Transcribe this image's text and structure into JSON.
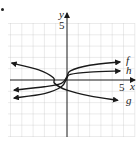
{
  "chart_data": {
    "type": "line",
    "title": "",
    "xlabel": "x",
    "ylabel": "y",
    "xlim": [
      -5,
      6
    ],
    "ylim": [
      -5,
      5
    ],
    "grid": true,
    "tick_labels": {
      "x": "5",
      "y": "5"
    },
    "series": [
      {
        "name": "f",
        "description": "cube-root shaped, increasing",
        "points": [
          [
            -4.7,
            -0.9
          ],
          [
            -2,
            -0.6
          ],
          [
            -0.5,
            -0.3
          ],
          [
            0,
            0.3
          ],
          [
            0.3,
            0.8
          ],
          [
            2,
            1.3
          ],
          [
            4.7,
            1.6
          ]
        ]
      },
      {
        "name": "h",
        "description": "cube-root shaped, increasing, flatter",
        "points": [
          [
            -4.7,
            -1.6
          ],
          [
            -2,
            -1.2
          ],
          [
            -0.5,
            -0.6
          ],
          [
            0,
            0.2
          ],
          [
            0.3,
            0.5
          ],
          [
            2,
            0.7
          ],
          [
            4.7,
            0.8
          ]
        ]
      },
      {
        "name": "g",
        "description": "reflected cube-root, decreasing",
        "points": [
          [
            -4.9,
            1.5
          ],
          [
            -2.5,
            0.9
          ],
          [
            -1.2,
            0.2
          ],
          [
            -1.1,
            -0.3
          ],
          [
            0,
            -0.9
          ],
          [
            2,
            -1.4
          ],
          [
            4.5,
            -1.8
          ]
        ]
      }
    ],
    "labels": {
      "f": "f",
      "h": "h",
      "g": "g",
      "x_axis": "x",
      "y_axis": "y",
      "x_tick": "5",
      "y_tick": "5"
    }
  }
}
